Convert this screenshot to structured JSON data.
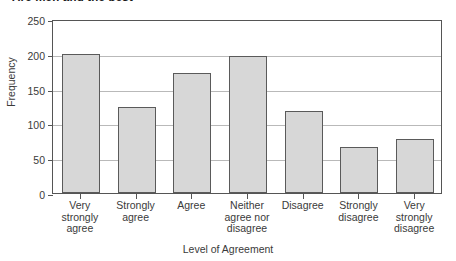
{
  "chart_data": {
    "type": "bar",
    "title": "Are men and the best",
    "xlabel": "Level of Agreement",
    "ylabel": "Frequency",
    "categories": [
      "Very\nstrongly\nagree",
      "Strongly\nagree",
      "Agree",
      "Neither\nagree nor\ndisagree",
      "Disagree",
      "Strongly\ndisagree",
      "Very\nstrongly\ndisagree"
    ],
    "values": [
      200,
      123,
      172,
      197,
      118,
      66,
      77
    ],
    "ylim": [
      0,
      250
    ],
    "yticks": [
      0,
      50,
      100,
      150,
      200,
      250
    ],
    "grid": true,
    "legend": "none",
    "bar_fill_color": "#d7d7d7",
    "bar_border_color": "#5a5a5a",
    "axis_color": "#555555",
    "gridline_color": "#b9b9b9"
  }
}
